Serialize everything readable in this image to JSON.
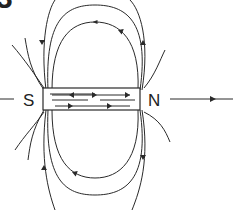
{
  "figure": {
    "partial_label": "3",
    "south_label": "S",
    "north_label": "N"
  },
  "colors": {
    "line": "#2a2a2a",
    "background": "#ffffff"
  }
}
